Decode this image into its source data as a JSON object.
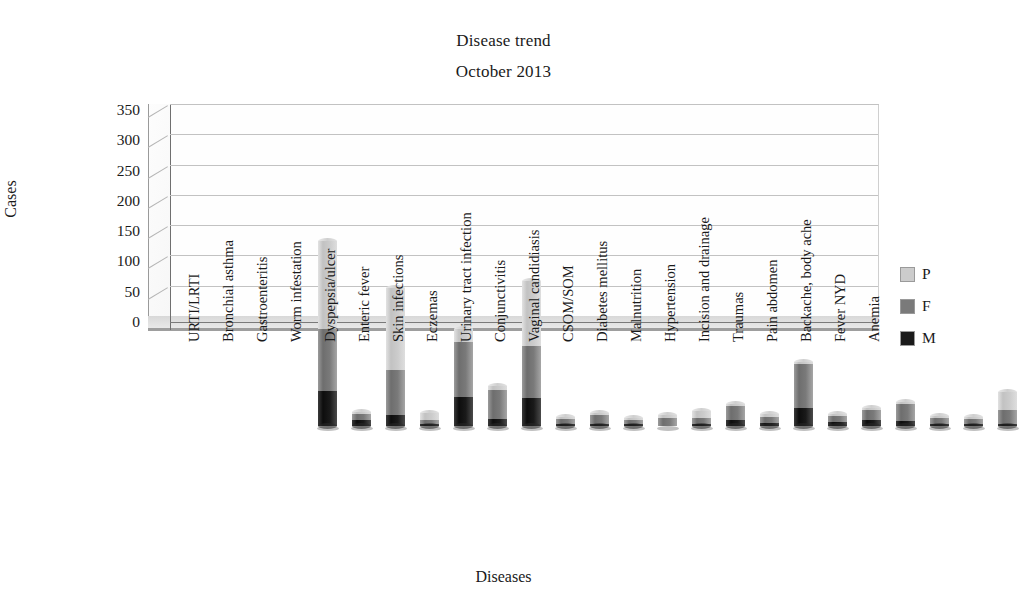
{
  "chart": {
    "title_line1": "Disease trend",
    "title_line2": "October 2013",
    "xlabel": "Diseases",
    "ylabel": "Cases"
  },
  "chart_data": {
    "type": "bar",
    "subtype": "stacked-column-3d",
    "title": "Disease trend October 2013",
    "xlabel": "Diseases",
    "ylabel": "Cases",
    "ylim": [
      0,
      350
    ],
    "yticks": [
      0,
      50,
      100,
      150,
      200,
      250,
      300,
      350
    ],
    "grid": true,
    "legend_position": "right",
    "stacked": true,
    "categories": [
      "URTI/LRTI",
      "Bronchial asthma",
      "Gastroenteritis",
      "Worm infestation",
      "Dyspepsia/ulcer",
      "Enteric fever",
      "Skin infections",
      "Eczemas",
      "Urinary tract infection",
      "Conjunctivitis",
      "Vaginal candidiasis",
      "CSOM/SOM",
      "Diabetes mellitus",
      "Malnutrition",
      "Hypertension",
      "Incision and drainage",
      "Traumas",
      "Pain abdomen",
      "Backache, body ache",
      "Fever NYD",
      "Anemia"
    ],
    "series": [
      {
        "name": "M",
        "color": "#1a1a1a",
        "values": [
          57,
          10,
          18,
          4,
          48,
          12,
          46,
          3,
          4,
          2,
          0,
          4,
          10,
          5,
          30,
          6,
          10,
          8,
          3,
          3,
          4
        ]
      },
      {
        "name": "F",
        "color": "#7a7a7a",
        "values": [
          103,
          10,
          75,
          6,
          91,
          48,
          86,
          8,
          14,
          6,
          14,
          9,
          23,
          10,
          73,
          10,
          16,
          28,
          10,
          8,
          22
        ]
      },
      {
        "name": "P",
        "color": "#cccccc",
        "values": [
          145,
          2,
          135,
          12,
          21,
          6,
          108,
          2,
          3,
          3,
          4,
          11,
          4,
          5,
          2,
          2,
          1,
          4,
          1,
          3,
          30
        ]
      }
    ],
    "totals": [
      305,
      22,
      228,
      22,
      160,
      66,
      240,
      13,
      21,
      11,
      18,
      24,
      37,
      20,
      105,
      18,
      27,
      40,
      14,
      14,
      56
    ]
  },
  "legend": [
    {
      "label": "P",
      "color": "#cccccc"
    },
    {
      "label": "F",
      "color": "#7a7a7a"
    },
    {
      "label": "M",
      "color": "#1a1a1a"
    }
  ]
}
